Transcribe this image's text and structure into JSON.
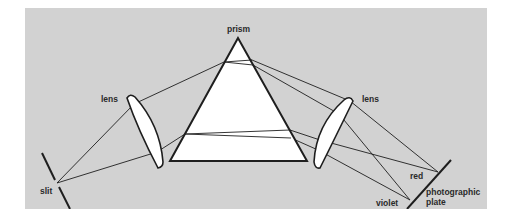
{
  "diagram": {
    "colors": {
      "background": "#d2d2d2",
      "line": "#1e1e1e",
      "glass": "#ffffff"
    },
    "labels": {
      "prism": "prism",
      "lens_left": "lens",
      "lens_right": "lens",
      "slit": "slit",
      "red": "red",
      "violet": "violet",
      "plate_line1": "photographic",
      "plate_line2": "plate"
    }
  }
}
